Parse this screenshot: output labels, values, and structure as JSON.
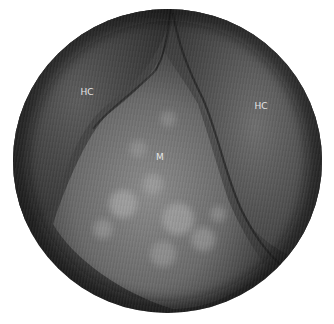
{
  "image": {
    "description": "Circular grayscale endoscopic view",
    "labels": [
      {
        "text": "HC",
        "x": 87,
        "y": 92
      },
      {
        "text": "HC",
        "x": 261,
        "y": 106
      },
      {
        "text": "M",
        "x": 160,
        "y": 157
      }
    ],
    "colors": {
      "background": "#ffffff",
      "field_dark": "#1e1e1e",
      "field_mid": "#4a4a4a",
      "tissue_light": "#9a9a9a"
    }
  }
}
